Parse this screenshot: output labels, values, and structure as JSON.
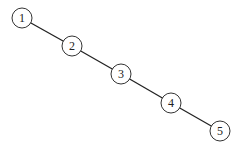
{
  "diagram": {
    "type": "tree-chain",
    "nodes": [
      {
        "id": "1",
        "label": "1",
        "x": 22,
        "y": 18
      },
      {
        "id": "2",
        "label": "2",
        "x": 72,
        "y": 46
      },
      {
        "id": "3",
        "label": "3",
        "x": 121,
        "y": 74
      },
      {
        "id": "4",
        "label": "4",
        "x": 171,
        "y": 103
      },
      {
        "id": "5",
        "label": "5",
        "x": 220,
        "y": 131
      }
    ],
    "edges": [
      {
        "from": "1",
        "to": "2"
      },
      {
        "from": "2",
        "to": "3"
      },
      {
        "from": "3",
        "to": "4"
      },
      {
        "from": "4",
        "to": "5"
      }
    ]
  }
}
